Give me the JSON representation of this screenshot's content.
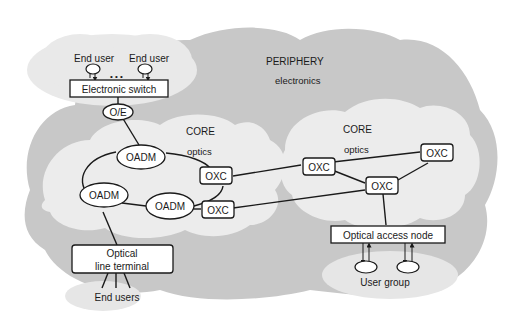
{
  "regions": {
    "periphery": {
      "title": "PERIPHERY",
      "subtitle": "electronics"
    },
    "core_left": {
      "title": "CORE",
      "subtitle": "optics"
    },
    "core_right": {
      "title": "CORE",
      "subtitle": "optics"
    }
  },
  "nodes": {
    "end_user_1": "End user",
    "end_user_2": "End user",
    "ellipsis": "• • •",
    "electronic_switch": "Electronic switch",
    "oe": "O/E",
    "oadm_top": "OADM",
    "oadm_left": "OADM",
    "oadm_bottom": "OADM",
    "oxc_left_top": "OXC",
    "oxc_left_bottom": "OXC",
    "oxc_mid": "OXC",
    "oxc_right_top": "OXC",
    "oxc_right_bottom": "OXC",
    "olt_line1": "Optical",
    "olt_line2": "line terminal",
    "end_users": "End users",
    "optical_access_node": "Optical access node",
    "user_group": "User group"
  },
  "colors": {
    "periphery_fill": "#c8c8c8",
    "core_fill": "#ececec",
    "user_cloud_fill": "#e6e6e6",
    "stroke": "#1a1a1a",
    "node_fill": "#ffffff"
  }
}
